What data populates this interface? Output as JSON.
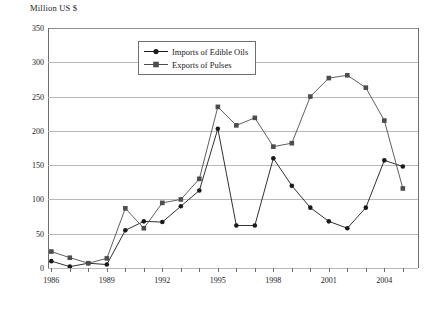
{
  "chart_data": {
    "type": "line",
    "title": "",
    "ylabel": "Million  US $",
    "xlabel": "",
    "ylim": [
      0,
      350
    ],
    "ytick_step": 50,
    "yticks": [
      0,
      50,
      100,
      150,
      200,
      250,
      300,
      350
    ],
    "grid": true,
    "legend_position": "upper-center",
    "x": [
      1986,
      1987,
      1988,
      1989,
      1990,
      1991,
      1992,
      1993,
      1994,
      1995,
      1996,
      1997,
      1998,
      1999,
      2000,
      2001,
      2002,
      2003,
      2004,
      2005
    ],
    "xtick_labels": [
      "1986",
      "1989",
      "1992",
      "1995",
      "1998",
      "2001",
      "2004"
    ],
    "xtick_years": [
      1986,
      1989,
      1992,
      1995,
      1998,
      2001,
      2004
    ],
    "series": [
      {
        "name": "Imports of Edible Oils",
        "marker": "circle",
        "color": "#1a1a1a",
        "values": [
          10,
          2,
          7,
          5,
          55,
          68,
          67,
          90,
          113,
          203,
          62,
          62,
          160,
          120,
          88,
          68,
          58,
          88,
          157,
          148
        ]
      },
      {
        "name": "Exports of Pulses",
        "marker": "square",
        "color": "#4d4d4d",
        "values": [
          24,
          15,
          7,
          14,
          87,
          58,
          95,
          100,
          130,
          235,
          208,
          219,
          177,
          182,
          250,
          277,
          281,
          263,
          215,
          116
        ]
      }
    ]
  },
  "legend": {
    "items": [
      {
        "label": "Imports of Edible Oils"
      },
      {
        "label": "Exports of Pulses"
      }
    ]
  }
}
